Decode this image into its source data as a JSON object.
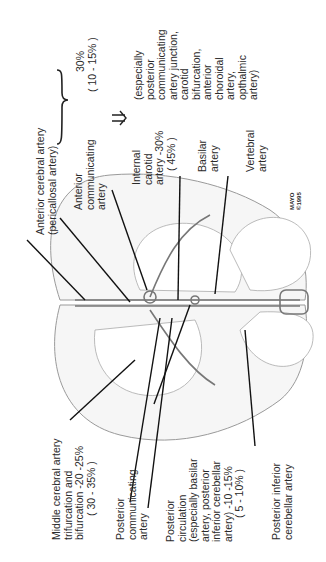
{
  "diagram": {
    "labels": {
      "aca": [
        "Anterior cerebral artery",
        "(pericallosal artery)"
      ],
      "acom": [
        "Anterior",
        "communicating",
        "artery"
      ],
      "ica": [
        "Internal",
        "carotid",
        "artery -30%",
        "( 45% )"
      ],
      "basilar": [
        "Basilar",
        "artery"
      ],
      "vertebral": [
        "Vertebral",
        "artery"
      ],
      "brace_pct": [
        "30%",
        "( 10 - 15% )"
      ],
      "especially": [
        "(especially",
        "posterior",
        "communicating",
        "artery junction,",
        "carotid",
        "bifurcation,",
        "anterior",
        "choroidal",
        "artery,",
        "opthalmic",
        "artery)"
      ],
      "mca": [
        "Middle cerebral artery",
        "trifurcation and",
        "bifurcation -20 -25%",
        "( 30 - 35% )"
      ],
      "pcom": [
        "Posterior",
        "communicating",
        "artery"
      ],
      "post_circ": [
        "Posterior",
        "circulation",
        "(especially basilar",
        "artery, posterior",
        "inferior cerebellar",
        "artery) -10 -15%",
        "( 5 - 10% )"
      ],
      "pica": [
        "Posterior inferior",
        "cerebellar artery"
      ],
      "mayo": [
        "MAYO",
        "©1995"
      ]
    }
  }
}
